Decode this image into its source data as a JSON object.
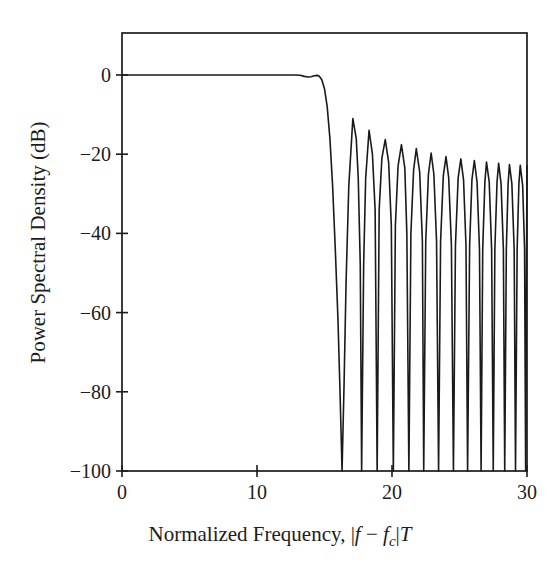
{
  "figure": {
    "background_color": "#ffffff",
    "line_color": "#1a1a1a",
    "axis_color": "#1c1c1c",
    "line_width": 1.6
  },
  "axes": {
    "x_title_prefix": "Normalized Frequency, ",
    "x_title_math_open": "|",
    "x_title_f": "f",
    "x_title_minus": " − ",
    "x_title_fc_base": "f",
    "x_title_fc_sub": "c",
    "x_title_math_close": "|",
    "x_title_T": "T",
    "y_title": "Power Spectral Density (dB)",
    "x_ticks": [
      "0",
      "10",
      "20",
      "30"
    ],
    "y_ticks": [
      "0",
      "−20",
      "−40",
      "−60",
      "−80",
      "−100"
    ]
  },
  "chart_data": {
    "type": "line",
    "title": "",
    "xlabel": "Normalized Frequency, |f - f_c| T",
    "ylabel": "Power Spectral Density (dB)",
    "xlim": [
      0,
      30
    ],
    "ylim": [
      -100,
      10.6
    ],
    "grid": false,
    "legend": null,
    "xticks": [
      0,
      10,
      20,
      30
    ],
    "yticks": [
      0,
      -20,
      -40,
      -60,
      -80,
      -100
    ],
    "series": [
      {
        "name": "Power Spectral Density",
        "color": "#1a1a1a",
        "description": "Flat 0 dB passband to f~14.8 with slight ripple dip/bump at the band edge, very steep rolloff, then decaying sidelobe lobes with deep nulls reaching the -100 dB floor.",
        "passband_level_db": 0,
        "band_edge": 14.9,
        "floor_db": -100,
        "sidelobe_peaks": [
          {
            "x": 17.1,
            "y": -11.0
          },
          {
            "x": 18.3,
            "y": -14.0
          },
          {
            "x": 19.5,
            "y": -16.3
          },
          {
            "x": 20.7,
            "y": -17.6
          },
          {
            "x": 21.8,
            "y": -18.6
          },
          {
            "x": 22.9,
            "y": -19.7
          },
          {
            "x": 24.0,
            "y": -20.6
          },
          {
            "x": 25.1,
            "y": -21.2
          },
          {
            "x": 26.1,
            "y": -21.6
          },
          {
            "x": 27.0,
            "y": -22.0
          },
          {
            "x": 27.9,
            "y": -22.3
          },
          {
            "x": 28.7,
            "y": -22.6
          },
          {
            "x": 29.5,
            "y": -22.8
          }
        ],
        "nulls": [
          16.3,
          17.7,
          18.9,
          20.1,
          21.25,
          22.35,
          23.45,
          24.55,
          25.6,
          26.6,
          27.5,
          28.35,
          29.15,
          29.9
        ],
        "points": [
          [
            0.0,
            0.0
          ],
          [
            1.0,
            0.0
          ],
          [
            2.0,
            0.0
          ],
          [
            3.0,
            0.0
          ],
          [
            4.0,
            0.0
          ],
          [
            5.0,
            0.0
          ],
          [
            6.0,
            0.0
          ],
          [
            7.0,
            0.0
          ],
          [
            8.0,
            0.0
          ],
          [
            9.0,
            0.0
          ],
          [
            10.0,
            0.0
          ],
          [
            11.0,
            0.0
          ],
          [
            12.0,
            0.0
          ],
          [
            12.8,
            0.0
          ],
          [
            13.2,
            -0.05
          ],
          [
            13.5,
            -0.35
          ],
          [
            13.8,
            -0.5
          ],
          [
            14.0,
            -0.45
          ],
          [
            14.25,
            -0.2
          ],
          [
            14.45,
            -0.1
          ],
          [
            14.6,
            -0.25
          ],
          [
            14.8,
            -1.2
          ],
          [
            15.0,
            -3.5
          ],
          [
            15.2,
            -8.0
          ],
          [
            15.4,
            -16.0
          ],
          [
            15.6,
            -28.0
          ],
          [
            15.8,
            -44.0
          ],
          [
            16.0,
            -62.0
          ],
          [
            16.15,
            -80.0
          ],
          [
            16.3,
            -100.0
          ],
          [
            16.45,
            -78.0
          ],
          [
            16.6,
            -52.0
          ],
          [
            16.8,
            -28.0
          ],
          [
            17.1,
            -11.0
          ],
          [
            17.35,
            -16.0
          ],
          [
            17.5,
            -26.0
          ],
          [
            17.65,
            -48.0
          ],
          [
            17.75,
            -100.0
          ],
          [
            17.9,
            -48.0
          ],
          [
            18.05,
            -26.0
          ],
          [
            18.3,
            -14.0
          ],
          [
            18.55,
            -20.0
          ],
          [
            18.75,
            -34.0
          ],
          [
            18.9,
            -100.0
          ],
          [
            19.05,
            -34.0
          ],
          [
            19.25,
            -21.0
          ],
          [
            19.5,
            -16.3
          ],
          [
            19.75,
            -22.0
          ],
          [
            19.95,
            -38.0
          ],
          [
            20.1,
            -100.0
          ],
          [
            20.25,
            -38.0
          ],
          [
            20.45,
            -23.0
          ],
          [
            20.7,
            -17.6
          ],
          [
            20.95,
            -23.5
          ],
          [
            21.1,
            -40.0
          ],
          [
            21.25,
            -100.0
          ],
          [
            21.4,
            -40.0
          ],
          [
            21.6,
            -24.0
          ],
          [
            21.8,
            -18.6
          ],
          [
            22.05,
            -24.5
          ],
          [
            22.25,
            -42.0
          ],
          [
            22.35,
            -100.0
          ],
          [
            22.5,
            -42.0
          ],
          [
            22.7,
            -25.0
          ],
          [
            22.9,
            -19.7
          ],
          [
            23.1,
            -25.0
          ],
          [
            23.3,
            -42.0
          ],
          [
            23.45,
            -100.0
          ],
          [
            23.6,
            -42.0
          ],
          [
            23.8,
            -25.5
          ],
          [
            24.0,
            -20.6
          ],
          [
            24.2,
            -26.0
          ],
          [
            24.4,
            -43.0
          ],
          [
            24.55,
            -100.0
          ],
          [
            24.7,
            -43.0
          ],
          [
            24.9,
            -26.0
          ],
          [
            25.1,
            -21.2
          ],
          [
            25.3,
            -26.5
          ],
          [
            25.48,
            -43.0
          ],
          [
            25.6,
            -100.0
          ],
          [
            25.75,
            -43.0
          ],
          [
            25.92,
            -26.5
          ],
          [
            26.1,
            -21.6
          ],
          [
            26.3,
            -27.0
          ],
          [
            26.48,
            -44.0
          ],
          [
            26.6,
            -100.0
          ],
          [
            26.72,
            -44.0
          ],
          [
            26.88,
            -27.0
          ],
          [
            27.0,
            -22.0
          ],
          [
            27.2,
            -27.0
          ],
          [
            27.38,
            -44.0
          ],
          [
            27.5,
            -100.0
          ],
          [
            27.62,
            -44.0
          ],
          [
            27.78,
            -27.0
          ],
          [
            27.9,
            -22.3
          ],
          [
            28.08,
            -27.5
          ],
          [
            28.25,
            -44.0
          ],
          [
            28.35,
            -100.0
          ],
          [
            28.47,
            -44.0
          ],
          [
            28.6,
            -27.5
          ],
          [
            28.7,
            -22.6
          ],
          [
            28.88,
            -27.5
          ],
          [
            29.05,
            -44.0
          ],
          [
            29.15,
            -100.0
          ],
          [
            29.27,
            -44.0
          ],
          [
            29.4,
            -27.5
          ],
          [
            29.5,
            -22.8
          ],
          [
            29.68,
            -28.0
          ],
          [
            29.82,
            -44.0
          ],
          [
            29.9,
            -100.0
          ],
          [
            29.96,
            -50.0
          ],
          [
            30.0,
            -23.0
          ]
        ]
      }
    ]
  },
  "geometry": {
    "plot_left_px": 122,
    "plot_right_px": 527,
    "plot_top_px": 33,
    "plot_bottom_px": 471
  }
}
